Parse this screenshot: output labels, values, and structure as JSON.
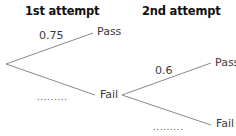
{
  "headers": {
    "first": "1st attempt",
    "second": "2nd attempt"
  },
  "first_attempt": {
    "pass_label": "Pass",
    "fail_label": "Fail",
    "pass_probability": "0.75",
    "fail_probability": "........."
  },
  "second_attempt": {
    "pass_label": "Pass",
    "fail_label": "Fail",
    "pass_probability": "0.6",
    "fail_probability": "........."
  },
  "colors": {
    "line": "#8a8a8a",
    "text": "#3a3a3a",
    "header": "#111111"
  }
}
